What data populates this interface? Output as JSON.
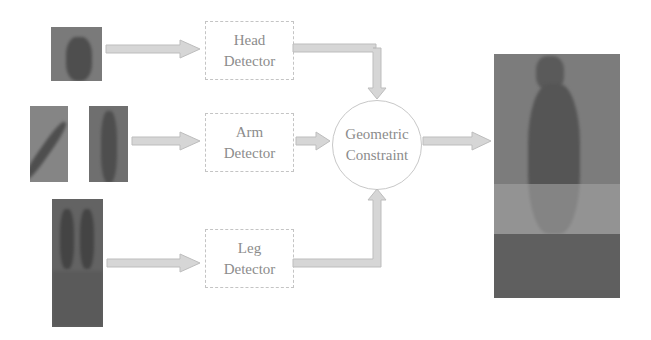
{
  "diagram": {
    "inputs": [
      {
        "id": "head-patch",
        "label": "head image patch"
      },
      {
        "id": "arm-patch-left",
        "label": "left arm image patch"
      },
      {
        "id": "arm-patch-right",
        "label": "right arm image patch"
      },
      {
        "id": "leg-patch",
        "label": "leg image patch"
      }
    ],
    "detectors": [
      {
        "line1": "Head",
        "line2": "Detector"
      },
      {
        "line1": "Arm",
        "line2": "Detector"
      },
      {
        "line1": "Leg",
        "line2": "Detector"
      }
    ],
    "combiner": {
      "line1": "Geometric",
      "line2": "Constraint"
    },
    "output": {
      "label": "full-body detection result image"
    },
    "colors": {
      "arrow_fill": "#d6d6d6",
      "arrow_stroke": "#bdbdbd",
      "box_border": "#c4c4c4",
      "text": "#8c8c8c",
      "photo": "#7a7a7a"
    }
  }
}
